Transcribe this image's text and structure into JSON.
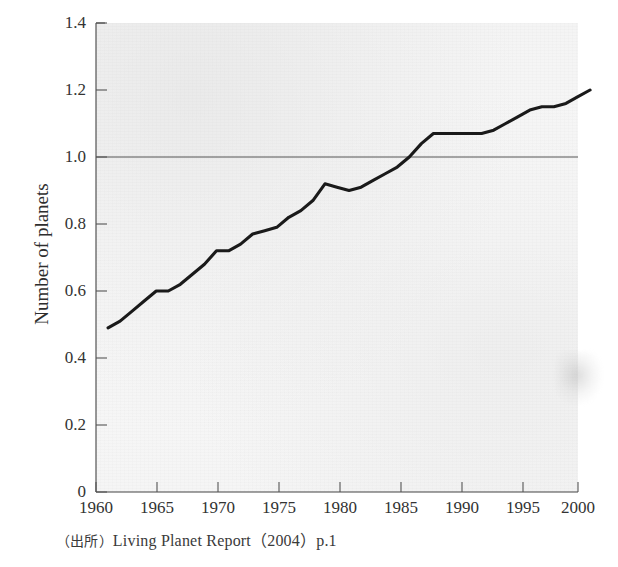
{
  "figure": {
    "y_axis_title": "Number of planets",
    "source_caption_prefix": "（出所）",
    "source_caption_text": "Living Planet Report（2004）p.1",
    "source_caption_full": "（出所）Living Planet Report（2004）p.1",
    "line_color": "#1a1a1a",
    "gridline_color": "#555555",
    "axis_color": "#444444",
    "plot_background": "#f6f6f6"
  },
  "chart_data": {
    "type": "line",
    "title": "",
    "subtitle": "",
    "xlabel": "",
    "ylabel": "Number of planets",
    "xlim": [
      1960,
      2002
    ],
    "ylim": [
      0,
      1.4
    ],
    "grid": false,
    "reference_lines": [
      {
        "axis": "y",
        "value": 1.0,
        "label": ""
      }
    ],
    "legend": [],
    "legend_position": "none",
    "xticks": [
      1960,
      1965,
      1970,
      1975,
      1980,
      1985,
      1990,
      1995,
      2000
    ],
    "xtick_labels": [
      "1960",
      "1965",
      "1970",
      "1975",
      "1980",
      "1985",
      "1990",
      "1995",
      "2000"
    ],
    "yticks": [
      0,
      0.2,
      0.4,
      0.6,
      0.8,
      1.0,
      1.2,
      1.4
    ],
    "ytick_labels": [
      "0",
      "0.2",
      "0.4",
      "0.6",
      "0.8",
      "1.0",
      "1.2",
      "1.4"
    ],
    "series": [
      {
        "name": "Ecological footprint (number of planets)",
        "color": "#1a1a1a",
        "x": [
          1961,
          1962,
          1963,
          1964,
          1965,
          1966,
          1967,
          1968,
          1969,
          1970,
          1971,
          1972,
          1973,
          1974,
          1975,
          1976,
          1977,
          1978,
          1979,
          1980,
          1981,
          1982,
          1983,
          1984,
          1985,
          1986,
          1987,
          1988,
          1989,
          1990,
          1991,
          1992,
          1993,
          1994,
          1995,
          1996,
          1997,
          1998,
          1999,
          2000,
          2001
        ],
        "values": [
          0.49,
          0.51,
          0.54,
          0.57,
          0.6,
          0.6,
          0.62,
          0.65,
          0.68,
          0.72,
          0.72,
          0.74,
          0.77,
          0.78,
          0.79,
          0.82,
          0.84,
          0.87,
          0.92,
          0.91,
          0.9,
          0.91,
          0.93,
          0.95,
          0.97,
          1.0,
          1.04,
          1.07,
          1.07,
          1.07,
          1.07,
          1.07,
          1.08,
          1.1,
          1.12,
          1.14,
          1.15,
          1.15,
          1.16,
          1.18,
          1.2
        ]
      }
    ],
    "annotations": []
  }
}
